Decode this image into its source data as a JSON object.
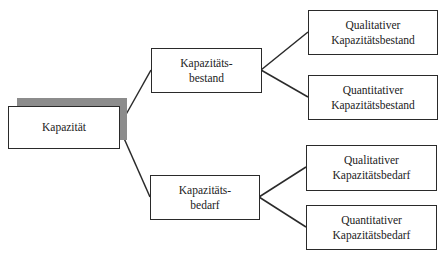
{
  "diagram": {
    "type": "tree",
    "root": {
      "id": "kapazitaet",
      "label": "Kapazität"
    },
    "level1": [
      {
        "id": "bestand",
        "label": "Kapazitäts-\nbestand"
      },
      {
        "id": "bedarf",
        "label": "Kapazitäts-\nbedarf"
      }
    ],
    "level2": [
      {
        "id": "qual-bestand",
        "parent": "bestand",
        "label": "Qualitativer\nKapazitätsbestand"
      },
      {
        "id": "quant-bestand",
        "parent": "bestand",
        "label": "Quantitativer\nKapazitätsbestand"
      },
      {
        "id": "qual-bedarf",
        "parent": "bedarf",
        "label": "Qualitativer\nKapazitätsbedarf"
      },
      {
        "id": "quant-bedarf",
        "parent": "bedarf",
        "label": "Quantitativer\nKapazitätsbedarf"
      }
    ],
    "colors": {
      "border": "#2a2a2a",
      "shadow": "#8c8c8c",
      "background": "#ffffff"
    }
  }
}
